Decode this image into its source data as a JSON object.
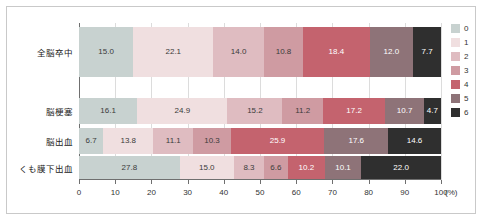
{
  "chart_data": {
    "type": "bar",
    "orientation": "horizontal",
    "stacked": true,
    "normalized_percent": true,
    "title": "",
    "xlabel": "(%)",
    "ylabel": "",
    "xlim": [
      0,
      100
    ],
    "xticks": [
      0,
      10,
      20,
      30,
      40,
      50,
      60,
      70,
      80,
      90,
      100
    ],
    "xtick_labels": [
      "0",
      "10",
      "20",
      "30",
      "40",
      "50",
      "60",
      "70",
      "80",
      "90",
      "100"
    ],
    "grid": true,
    "legend_position": "right",
    "categories": [
      "全脳卒中",
      "脳梗塞",
      "脳出血",
      "くも膜下出血"
    ],
    "series": [
      {
        "name": "0",
        "color": "#c8d2d0",
        "values": [
          15.0,
          16.1,
          6.7,
          27.8
        ]
      },
      {
        "name": "1",
        "color": "#f0dfe0",
        "values": [
          22.1,
          24.9,
          13.8,
          15.0
        ]
      },
      {
        "name": "2",
        "color": "#dfbcc1",
        "values": [
          14.0,
          15.2,
          11.1,
          8.3
        ]
      },
      {
        "name": "3",
        "color": "#cf9ba2",
        "values": [
          10.8,
          11.2,
          10.3,
          6.6
        ]
      },
      {
        "name": "4",
        "color": "#c4636e",
        "values": [
          18.4,
          17.2,
          25.9,
          10.2
        ]
      },
      {
        "name": "5",
        "color": "#8e7378",
        "values": [
          12.0,
          10.7,
          17.6,
          10.1
        ]
      },
      {
        "name": "6",
        "color": "#2f2f2f",
        "values": [
          7.7,
          4.7,
          14.6,
          22.0
        ]
      }
    ]
  },
  "legend": {
    "items": [
      {
        "label": "0",
        "color": "#c8d2d0"
      },
      {
        "label": "1",
        "color": "#f0dfe0"
      },
      {
        "label": "2",
        "color": "#dfbcc1"
      },
      {
        "label": "3",
        "color": "#cf9ba2"
      },
      {
        "label": "4",
        "color": "#c4636e"
      },
      {
        "label": "5",
        "color": "#8e7378"
      },
      {
        "label": "6",
        "color": "#2f2f2f"
      }
    ]
  },
  "axis": {
    "x_unit": "(%)"
  }
}
